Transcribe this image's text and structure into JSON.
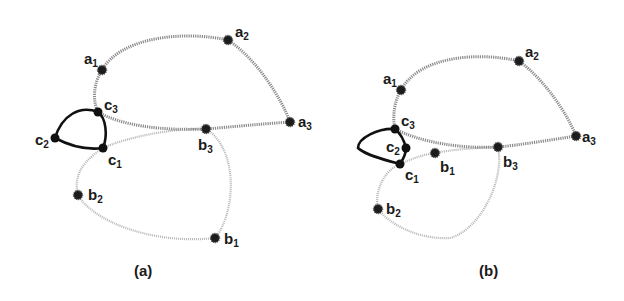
{
  "figure": {
    "panels": [
      {
        "caption": "(a)",
        "nodes": {
          "a1": {
            "label": "a",
            "sub": "1"
          },
          "a2": {
            "label": "a",
            "sub": "2"
          },
          "a3": {
            "label": "a",
            "sub": "3"
          },
          "b1": {
            "label": "b",
            "sub": "1"
          },
          "b2": {
            "label": "b",
            "sub": "2"
          },
          "b3": {
            "label": "b",
            "sub": "3"
          },
          "c1": {
            "label": "c",
            "sub": "1"
          },
          "c2": {
            "label": "c",
            "sub": "2"
          },
          "c3": {
            "label": "c",
            "sub": "3"
          }
        }
      },
      {
        "caption": "(b)",
        "nodes": {
          "a1": {
            "label": "a",
            "sub": "1"
          },
          "a2": {
            "label": "a",
            "sub": "2"
          },
          "a3": {
            "label": "a",
            "sub": "3"
          },
          "b1": {
            "label": "b",
            "sub": "1"
          },
          "b2": {
            "label": "b",
            "sub": "2"
          },
          "b3": {
            "label": "b",
            "sub": "3"
          },
          "c1": {
            "label": "c",
            "sub": "1"
          },
          "c2": {
            "label": "c",
            "sub": "2"
          },
          "c3": {
            "label": "c",
            "sub": "3"
          }
        }
      }
    ],
    "colors": {
      "a_cycle": "#8a8a8a",
      "b_cycle": "#b5b5b5",
      "c_cycle": "#111111",
      "node": "#1c1c1c"
    }
  }
}
